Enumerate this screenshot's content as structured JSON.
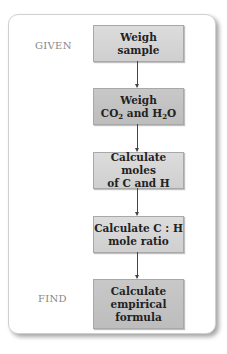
{
  "labels": {
    "given": "GIVEN",
    "find": "FIND"
  },
  "steps": [
    {
      "line1": "Weigh",
      "line2": "sample"
    },
    {
      "line1": "Weigh",
      "line2_parts": [
        "CO",
        "2",
        " and H",
        "2",
        "O"
      ]
    },
    {
      "line1": "Calculate moles",
      "line2": "of C and H"
    },
    {
      "line1": "Calculate C : H",
      "line2": "mole ratio"
    },
    {
      "line1": "Calculate",
      "line2": "empirical",
      "line3": "formula"
    }
  ]
}
